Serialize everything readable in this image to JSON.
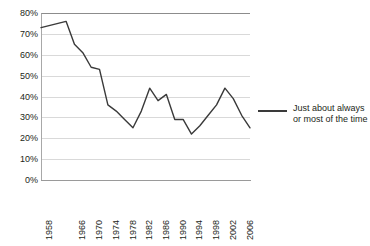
{
  "chart_data": {
    "type": "line",
    "title": "",
    "subtitle": "",
    "xlabel": "",
    "ylabel": "",
    "ylim": [
      0,
      80
    ],
    "xlim": [
      1958,
      2008
    ],
    "grid": true,
    "legend_position": "right",
    "ytick_labels": [
      "80%",
      "70%",
      "60%",
      "50%",
      "40%",
      "30%",
      "20%",
      "10%",
      "0%"
    ],
    "ytick_values": [
      80,
      70,
      60,
      50,
      40,
      30,
      20,
      10,
      0
    ],
    "xtick_labels": [
      "1958",
      "1966",
      "1970",
      "1974",
      "1978",
      "1982",
      "1986",
      "1990",
      "1994",
      "1998",
      "2002",
      "2006"
    ],
    "xtick_values": [
      1958,
      1966,
      1970,
      1974,
      1978,
      1982,
      1986,
      1990,
      1994,
      1998,
      2002,
      2006
    ],
    "series": [
      {
        "name": "Just about always or most of the time",
        "color": "#3a3a3a",
        "x": [
          1958,
          1964,
          1966,
          1968,
          1970,
          1972,
          1974,
          1976,
          1978,
          1980,
          1982,
          1984,
          1986,
          1988,
          1990,
          1992,
          1994,
          1996,
          1998,
          2000,
          2002,
          2004,
          2006,
          2008
        ],
        "values": [
          73,
          76,
          65,
          61,
          54,
          53,
          36,
          33,
          29,
          25,
          33,
          44,
          38,
          41,
          29,
          29,
          22,
          26,
          31,
          36,
          44,
          39,
          31,
          25
        ]
      }
    ]
  },
  "legend": {
    "label_line_1": "Just about always",
    "label_line_2": "or most of the time"
  }
}
